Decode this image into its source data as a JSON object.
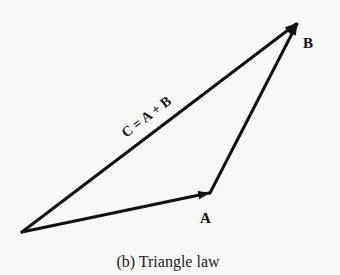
{
  "diagram": {
    "title": "Triangle law",
    "caption": "(b) Triangle law",
    "vectors": [
      {
        "name": "A",
        "label": "A",
        "from": [
          22,
          232
        ],
        "to": [
          210,
          193
        ]
      },
      {
        "name": "B",
        "label": "B",
        "from": [
          210,
          193
        ],
        "to": [
          298,
          22
        ]
      },
      {
        "name": "C",
        "label": "C = A + B",
        "from": [
          22,
          232
        ],
        "to": [
          298,
          22
        ]
      }
    ],
    "labels": {
      "a": "A",
      "b": "B",
      "c": "C = A + B"
    },
    "colors": {
      "stroke": "#111111",
      "background": "#f8f8f6"
    }
  }
}
